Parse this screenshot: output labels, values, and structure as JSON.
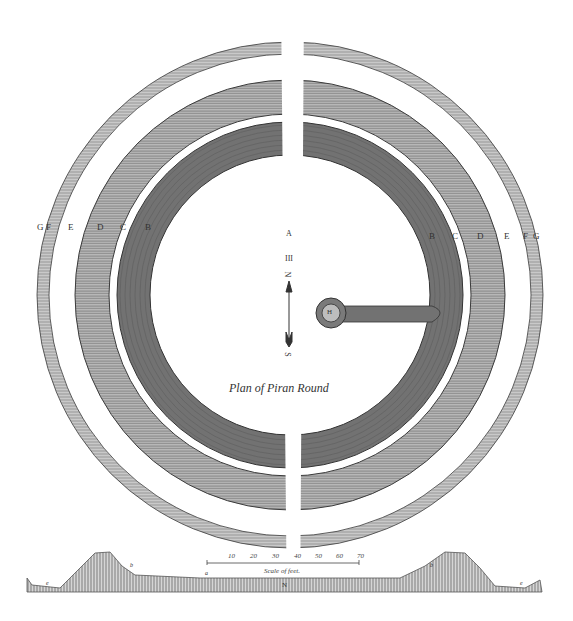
{
  "plate": {
    "title": "Plan of Piran Round",
    "center": {
      "x": 290,
      "y": 295
    },
    "colors": {
      "ink": "#3a3a3a",
      "paper": "#ffffff",
      "dark_band": "#6e6e6e",
      "mid_band": "#9a9a9a",
      "light_band": "#b0b0b0"
    }
  },
  "rings": [
    {
      "name": "outer-thin-ring",
      "outer_r": 253,
      "inner_r": 241
    },
    {
      "name": "middle-ring",
      "outer_r": 215,
      "inner_r": 181
    },
    {
      "name": "inner-dark-ring",
      "outer_r": 173,
      "inner_r": 140
    }
  ],
  "labels_left": [
    "G",
    "F",
    "E",
    "D",
    "C",
    "B"
  ],
  "labels_right": [
    "B",
    "C",
    "D",
    "E",
    "F",
    "G"
  ],
  "compass": {
    "top_letter": "A",
    "marker": "III",
    "north": "N",
    "south": "S"
  },
  "center_feature": {
    "label": "H"
  },
  "scale": {
    "title": "Scale of feet.",
    "ticks": [
      "10",
      "20",
      "30",
      "40",
      "50",
      "60",
      "70"
    ]
  },
  "section": {
    "left_letter": "e",
    "left_bank_letter": "b",
    "mid_letter": "a",
    "center_letter": "N",
    "right_bank_letter": "b",
    "right_letter": "e"
  }
}
